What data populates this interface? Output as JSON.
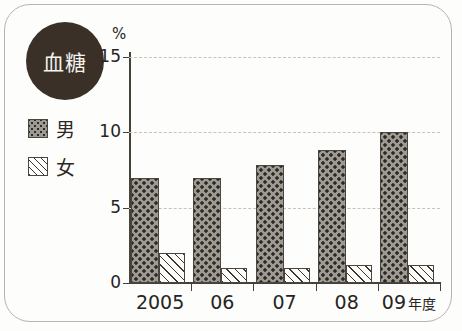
{
  "badge": {
    "label": "血糖"
  },
  "legend": {
    "items": [
      {
        "label": "男",
        "pattern": "dotted",
        "name": "male"
      },
      {
        "label": "女",
        "pattern": "hatched",
        "name": "female"
      }
    ]
  },
  "axis": {
    "y_unit": "%",
    "y_ticks": [
      "0",
      "5",
      "10",
      "15"
    ],
    "x_suffix": "年度"
  },
  "colors": {
    "badge": "#3a3027",
    "male_fill": "#9c9a92",
    "male_dots": "#2b2721",
    "female_fill": "#fdfcf9",
    "female_hatch": "#3a362f",
    "axis": "#45413a",
    "grid": "#c9c3b4",
    "frame": "#b9b5ac"
  },
  "chart_data": {
    "type": "bar",
    "title": "血糖",
    "xlabel": "年度",
    "ylabel": "%",
    "ylim": [
      0,
      15
    ],
    "yticks": [
      0,
      5,
      10,
      15
    ],
    "grid": true,
    "legend_position": "left",
    "categories": [
      "2005",
      "06",
      "07",
      "08",
      "09"
    ],
    "category_labels": [
      "2005",
      "06",
      "07",
      "08",
      "09 年度"
    ],
    "series": [
      {
        "name": "男",
        "values": [
          7.0,
          7.0,
          7.8,
          8.8,
          10.0
        ]
      },
      {
        "name": "女",
        "values": [
          2.0,
          1.0,
          1.0,
          1.2,
          1.2
        ]
      }
    ]
  }
}
